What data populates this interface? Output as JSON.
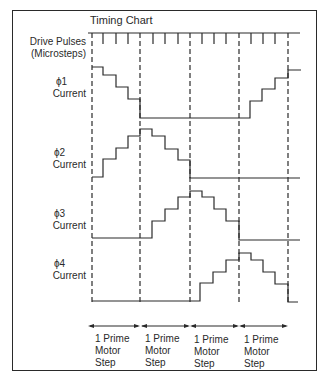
{
  "title": "Timing Chart",
  "row_labels": {
    "drive_pulses_line1": "Drive Pulses",
    "drive_pulses_line2": "(Microsteps)",
    "phi1_line1": "ϕ1",
    "phi1_line2": "Current",
    "phi2_line1": "ϕ2",
    "phi2_line2": "Current",
    "phi3_line1": "ϕ3",
    "phi3_line2": "Current",
    "phi4_line1": "ϕ4",
    "phi4_line2": "Current"
  },
  "step_labels": [
    {
      "line1": "1 Prime",
      "line2": "Motor",
      "line3": "Step"
    },
    {
      "line1": "1 Prime",
      "line2": "Motor",
      "line3": "Step"
    },
    {
      "line1": "1 Prime",
      "line2": "Motor",
      "line3": "Step"
    },
    {
      "line1": "1 Prime",
      "line2": "Motor",
      "line3": "Step"
    }
  ],
  "diagram": {
    "type": "timing-diagram",
    "microsteps_per_step": 4,
    "motor_steps_shown": 4,
    "phases": [
      {
        "name": "ϕ1",
        "levels": [
          4,
          3,
          2,
          1,
          0,
          0,
          0,
          0,
          0,
          0,
          0,
          0,
          1,
          2,
          3,
          4,
          4
        ]
      },
      {
        "name": "ϕ2",
        "levels": [
          0,
          1,
          2,
          3,
          4,
          3,
          2,
          1,
          0,
          0,
          0,
          0,
          0,
          0,
          0,
          0,
          0
        ]
      },
      {
        "name": "ϕ3",
        "levels": [
          0,
          0,
          0,
          0,
          0,
          1,
          2,
          3,
          4,
          3,
          2,
          1,
          0,
          0,
          0,
          0,
          0
        ]
      },
      {
        "name": "ϕ4",
        "levels": [
          0,
          0,
          0,
          0,
          0,
          0,
          0,
          0,
          0,
          1,
          2,
          3,
          4,
          3,
          2,
          1,
          0
        ]
      }
    ]
  }
}
